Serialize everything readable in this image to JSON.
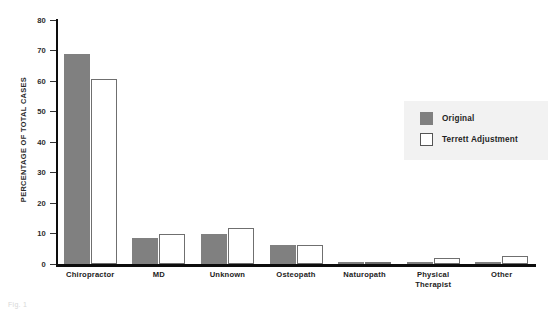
{
  "chart_data": {
    "type": "bar",
    "title": "",
    "xlabel": "",
    "ylabel": "PERCENTAGE OF TOTAL CASES",
    "ylim": [
      0,
      80
    ],
    "yticks": [
      0,
      10,
      20,
      30,
      40,
      50,
      60,
      70,
      80
    ],
    "grid": false,
    "legend_position": "right",
    "categories": [
      "Chiropractor",
      "MD",
      "Unknown",
      "Osteopath",
      "Naturopath",
      "Physical Therapist",
      "Other"
    ],
    "series": [
      {
        "name": "Original",
        "color": "#808080",
        "values": [
          69,
          8.5,
          10,
          6.3,
          0.8,
          0.8,
          0.8
        ]
      },
      {
        "name": "Terrett Adjustment",
        "color": "#ffffff",
        "values": [
          60.5,
          10,
          11.7,
          6.3,
          0.8,
          2,
          2.5
        ]
      }
    ]
  },
  "legend": {
    "items": [
      {
        "label": "Original",
        "swatch": "filled-gray-swatch"
      },
      {
        "label": "Terrett Adjustment",
        "swatch": "outlined-white-swatch"
      }
    ]
  },
  "caption": {
    "fragment": "Fig. 1"
  }
}
